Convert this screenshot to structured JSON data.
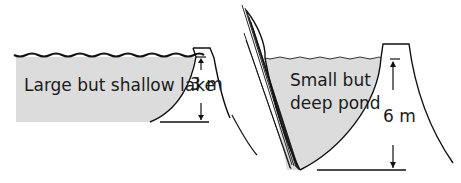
{
  "diagram": {
    "left": {
      "label": "Large but shallow lake",
      "dimension": "3 m"
    },
    "right": {
      "label_line1": "Small but",
      "label_line2": "deep pond",
      "dimension": "6 m"
    },
    "colors": {
      "water": "#dcdcdc",
      "line": "#111111",
      "background": "#ffffff"
    }
  }
}
